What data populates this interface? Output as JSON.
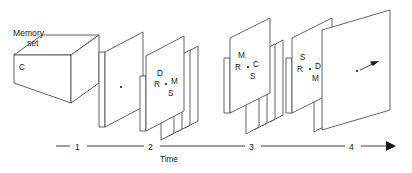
{
  "figure": {
    "ink_color": "#3c3c3c",
    "text_color": "#1a1a1a",
    "background": "#ffffff"
  },
  "memory_set": {
    "caption_line1": "Memory",
    "caption_line2": "set",
    "item": "C"
  },
  "frames": [
    {
      "id": "frame-1",
      "name": "blank-fixation-frame",
      "cards": 1,
      "has_fixation_dot": true,
      "letters": {
        "top": "",
        "left": "",
        "right": "",
        "bottom": ""
      }
    },
    {
      "id": "frame-2",
      "name": "display-frame-drms",
      "cards": 5,
      "has_fixation_dot": true,
      "letters": {
        "top": "D",
        "left": "R",
        "right": "M",
        "bottom": "S"
      }
    },
    {
      "id": "frame-3",
      "name": "display-frame-mrcs",
      "cards": 5,
      "has_fixation_dot": true,
      "letters": {
        "top": "M",
        "left": "R",
        "right": "C",
        "bottom": "S"
      }
    },
    {
      "id": "frame-4",
      "name": "display-frame-srdm",
      "cards": 4,
      "has_fixation_dot": true,
      "letters": {
        "top": "S",
        "left": "R",
        "right": "D",
        "bottom": "M"
      }
    },
    {
      "id": "frame-5",
      "name": "response-frame",
      "cards": 1,
      "has_fixation_dot": true,
      "has_response_arrow": true,
      "letters": {
        "top": "",
        "left": "",
        "right": "",
        "bottom": ""
      }
    }
  ],
  "axis": {
    "label": "Time",
    "ticks": [
      "1",
      "2",
      "3",
      "4"
    ],
    "has_end_arrow": true,
    "direction": "left-to-right"
  }
}
